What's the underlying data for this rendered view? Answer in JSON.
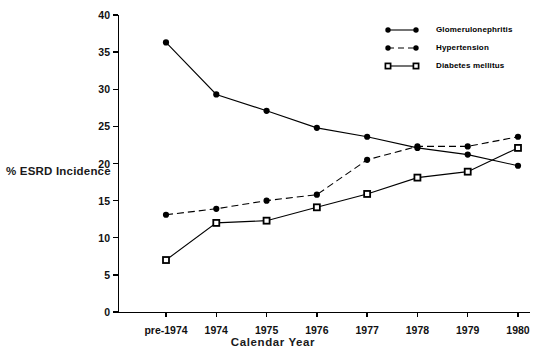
{
  "chart_data": {
    "type": "line",
    "title": "",
    "xlabel": "Calendar Year",
    "ylabel": "% ESRD Incidence",
    "categories": [
      "pre-1974",
      "1974",
      "1975",
      "1976",
      "1977",
      "1978",
      "1979",
      "1980"
    ],
    "ylim": [
      0,
      40
    ],
    "yticks": [
      0,
      5,
      10,
      15,
      20,
      25,
      30,
      35,
      40
    ],
    "grid": false,
    "legend_position": "top-right",
    "series": [
      {
        "name": "Glomerulonephritis",
        "marker": "filled-circle",
        "linestyle": "solid",
        "color": "#000000",
        "values": [
          36.3,
          29.3,
          27.1,
          24.8,
          23.6,
          22.1,
          21.2,
          19.7
        ]
      },
      {
        "name": "Hypertension",
        "marker": "filled-circle",
        "linestyle": "dashed",
        "color": "#000000",
        "values": [
          13.1,
          13.9,
          15.0,
          15.8,
          20.5,
          22.3,
          22.3,
          23.6
        ]
      },
      {
        "name": "Diabetes mellitus",
        "marker": "square",
        "linestyle": "solid",
        "color": "#000000",
        "values": [
          7.0,
          12.0,
          12.3,
          14.1,
          15.9,
          18.1,
          18.9,
          22.1
        ]
      }
    ]
  },
  "axis": {
    "ylabel": "% ESRD Incidence",
    "xlabel": "Calendar Year"
  },
  "legend": {
    "items": [
      {
        "label": "Glomerulonephritis"
      },
      {
        "label": "Hypertension"
      },
      {
        "label": "Diabetes mellitus"
      }
    ]
  }
}
